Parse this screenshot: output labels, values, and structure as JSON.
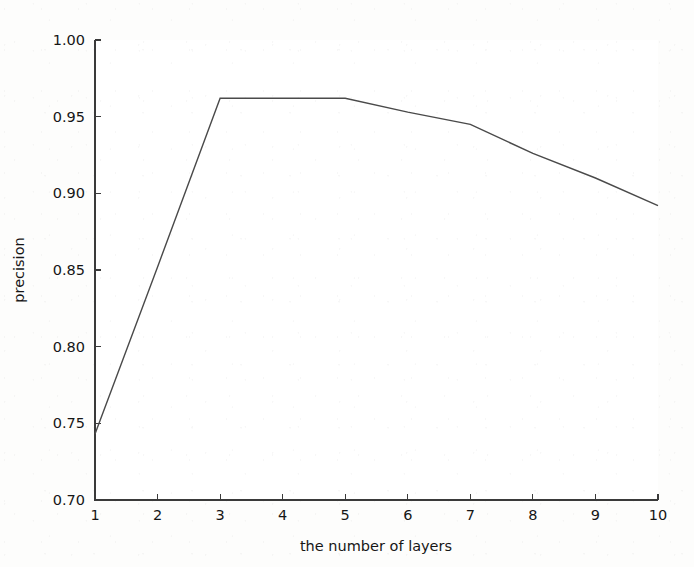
{
  "chart_data": {
    "type": "line",
    "title": "",
    "xlabel": "the number of layers",
    "ylabel": "precision",
    "x": [
      1,
      2,
      3,
      4,
      5,
      6,
      7,
      8,
      9,
      10
    ],
    "values": [
      0.743,
      0.852,
      0.962,
      0.962,
      0.962,
      0.953,
      0.945,
      0.926,
      0.91,
      0.892
    ],
    "series": [
      {
        "name": "precision",
        "values": [
          0.743,
          0.852,
          0.962,
          0.962,
          0.962,
          0.953,
          0.945,
          0.926,
          0.91,
          0.892
        ]
      }
    ],
    "xlim": [
      1,
      10
    ],
    "ylim": [
      0.7,
      1.0
    ],
    "xticks": [
      1,
      2,
      3,
      4,
      5,
      6,
      7,
      8,
      9,
      10
    ],
    "yticks": [
      0.7,
      0.75,
      0.8,
      0.85,
      0.9,
      0.95,
      1.0
    ],
    "xtick_labels": [
      "1",
      "2",
      "3",
      "4",
      "5",
      "6",
      "7",
      "8",
      "9",
      "10"
    ],
    "ytick_labels": [
      "0.70",
      "0.75",
      "0.80",
      "0.85",
      "0.90",
      "0.95",
      "1.00"
    ],
    "grid": false,
    "legend": false,
    "legend_position": "none",
    "line_color": "#4a4a4a",
    "background_color": "#fdfdfc",
    "axis_color": "#3a3a3a"
  }
}
